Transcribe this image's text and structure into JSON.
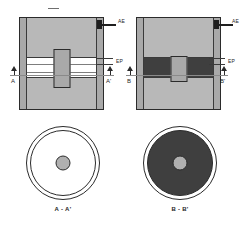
{
  "figure": {
    "title_mark": "—",
    "background_color": "#ffffff",
    "views": [
      {
        "id": "view-a",
        "name": "left-cross-section",
        "terminal_label": "AE",
        "electrode_label": "EP",
        "cut_label_left": "A",
        "cut_label_right": "A'",
        "mid_band_style": "light",
        "plunger_style": "tall"
      },
      {
        "id": "view-b",
        "name": "right-cross-section",
        "terminal_label": "AE",
        "electrode_label": "EP",
        "cut_label_left": "B",
        "cut_label_right": "B'",
        "mid_band_style": "dark",
        "plunger_style": "short"
      }
    ],
    "sections": [
      {
        "id": "section-aa",
        "caption": "A - A'",
        "fill": "light",
        "hub": "gray"
      },
      {
        "id": "section-bb",
        "caption": "B - B'",
        "fill": "dark",
        "hub": "gray"
      }
    ],
    "colors": {
      "outline": "#2b2b2b",
      "wall_gray": "#a9a9a9",
      "core_gray": "#b8b8b8",
      "dark_fill": "#3f3f3f",
      "light_fill": "#ffffff",
      "hub_gray": "#b0b0b0",
      "lead_black": "#1f1f1f"
    }
  }
}
